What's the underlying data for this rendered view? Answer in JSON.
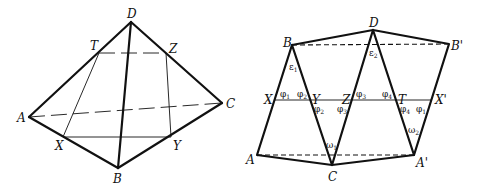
{
  "left_diagram": {
    "description": "Tetrahedron ABCD with cross-section XYZT",
    "labels": {
      "D": "D",
      "T": "T",
      "Z": "Z",
      "A": "A",
      "C": "C",
      "X": "X",
      "Y": "Y",
      "B": "B"
    }
  },
  "right_diagram": {
    "description": "Unfolded net of the tetrahedron with straight line XX'",
    "labels": {
      "D": "D",
      "B": "B",
      "B_prime": "B'",
      "X": "X",
      "Y": "Y",
      "Z": "Z",
      "T": "T",
      "X_prime": "X'",
      "A": "A",
      "C": "C",
      "A_prime": "A'"
    },
    "angles": {
      "eps1": {
        "sym": "ε",
        "sub": "1"
      },
      "eps2": {
        "sym": "ε",
        "sub": "2"
      },
      "phi1_a": {
        "sym": "φ",
        "sub": "1"
      },
      "phi2_a": {
        "sym": "φ",
        "sub": "2"
      },
      "phi2_b": {
        "sym": "φ",
        "sub": "2"
      },
      "phi3_a": {
        "sym": "φ",
        "sub": "3"
      },
      "phi3_b": {
        "sym": "φ",
        "sub": "3"
      },
      "phi4_a": {
        "sym": "φ",
        "sub": "4"
      },
      "phi4_b": {
        "sym": "φ",
        "sub": "4"
      },
      "phi1_b": {
        "sym": "φ",
        "sub": "1"
      },
      "omega1": {
        "sym": "ω",
        "sub": "1"
      },
      "omega2": {
        "sym": "ω",
        "sub": "2"
      }
    }
  }
}
